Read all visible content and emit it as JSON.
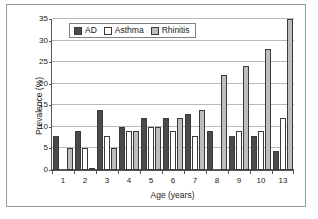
{
  "chart_data": {
    "type": "bar",
    "title": "",
    "xlabel": "Age (years)",
    "ylabel": "Prevalence (%)",
    "categories": [
      "1",
      "2",
      "3",
      "4",
      "5",
      "6",
      "7",
      "8",
      "9",
      "10",
      "13"
    ],
    "series": [
      {
        "name": "AD",
        "values": [
          8,
          9,
          14,
          10,
          12,
          12,
          13,
          9,
          8,
          8,
          4.5
        ]
      },
      {
        "name": "Asthma",
        "values": [
          0,
          5,
          8,
          9,
          10,
          9,
          8,
          0,
          9,
          9,
          12
        ]
      },
      {
        "name": "Rhinitis",
        "values": [
          5.2,
          0.5,
          5.2,
          9,
          10,
          12,
          14,
          22,
          24,
          28,
          35
        ]
      }
    ],
    "ylim": [
      0,
      35
    ],
    "yticks": [
      0,
      5,
      10,
      15,
      20,
      25,
      30,
      35
    ],
    "ytick_labels": [
      "0",
      "5",
      "10",
      "15",
      "20",
      "25",
      "30",
      "35"
    ],
    "grid": "horizontal",
    "legend_position": "top-left-inside",
    "colors": {
      "ad": "#4a4a4a",
      "asthma": "#ffffff",
      "rhinitis": "#bdbdbd",
      "bar_outline": "#3a3a3a",
      "gridline": "#b9b9b9",
      "axis": "#555555",
      "frame": "#9a9a9a",
      "background": "#ffffff"
    }
  },
  "legend": {
    "items": [
      {
        "label": "AD",
        "key": "ad"
      },
      {
        "label": "Asthma",
        "key": "asthma"
      },
      {
        "label": "Rhinitis",
        "key": "rhinitis"
      }
    ]
  }
}
